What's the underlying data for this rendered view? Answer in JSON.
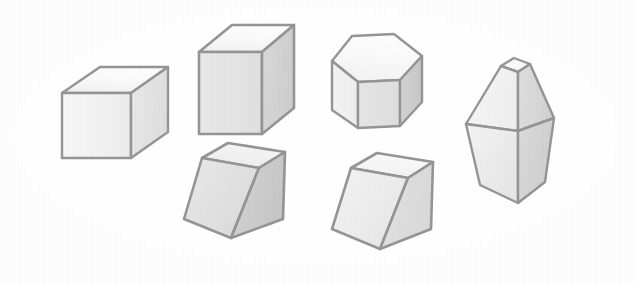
{
  "figure": {
    "width": 634,
    "height": 285
  },
  "colors": {
    "background": "#d4d4d4",
    "ellipse_fill": "#ffffff",
    "outline": "#2b2b2b",
    "face_top_light": "#f2f2f2",
    "face_top_mid": "#e8e8e8",
    "face_front_light": "#dedede",
    "face_front_mid": "#c6c6c6",
    "face_front_dark": "#b0b0b0",
    "face_side_dark": "#9a9a9a",
    "face_side_darker": "#8c8c8c"
  },
  "canvas": {
    "background_label": "light-gray-backdrop",
    "ellipse": {
      "label": "white-ellipse-field",
      "cx": 316,
      "cy": 136,
      "rx": 301,
      "ry": 126
    }
  },
  "shapes": [
    {
      "id": "cube-small",
      "label": "Small cube",
      "form": "cube",
      "position": "upper-left",
      "bbox": [
        62,
        66,
        106,
        92
      ],
      "faces": [
        "top",
        "front",
        "right"
      ]
    },
    {
      "id": "cube-large",
      "label": "Large cube",
      "form": "cube",
      "position": "upper-center-left",
      "bbox": [
        198,
        24,
        96,
        110
      ],
      "faces": [
        "top",
        "front",
        "right"
      ]
    },
    {
      "id": "hexagonal-prism",
      "label": "Hexagonal prism",
      "form": "hexagonal prism",
      "position": "upper-center-right",
      "bbox": [
        331,
        34,
        91,
        95
      ],
      "faces": [
        "top",
        "front-left",
        "front-center",
        "right"
      ]
    },
    {
      "id": "hexagonal-bipyramid",
      "label": "Hexagonal bipyramid",
      "form": "truncated hexagonal bipyramid",
      "position": "right",
      "bbox": [
        466,
        57,
        88,
        146
      ],
      "faces": [
        "apex-facet",
        "upper-left",
        "upper-right",
        "lower-left",
        "lower-right"
      ]
    },
    {
      "id": "rhombohedron-left",
      "label": "Rhombohedron, dark shading",
      "form": "rhombohedron",
      "position": "lower-center-left",
      "bbox": [
        184,
        142,
        102,
        96
      ],
      "faces": [
        "top",
        "front",
        "right"
      ]
    },
    {
      "id": "rhombohedron-right",
      "label": "Rhombohedron, light shading",
      "form": "rhombohedron",
      "position": "lower-center-right",
      "bbox": [
        332,
        153,
        101,
        96
      ],
      "faces": [
        "top",
        "front",
        "right"
      ]
    }
  ]
}
